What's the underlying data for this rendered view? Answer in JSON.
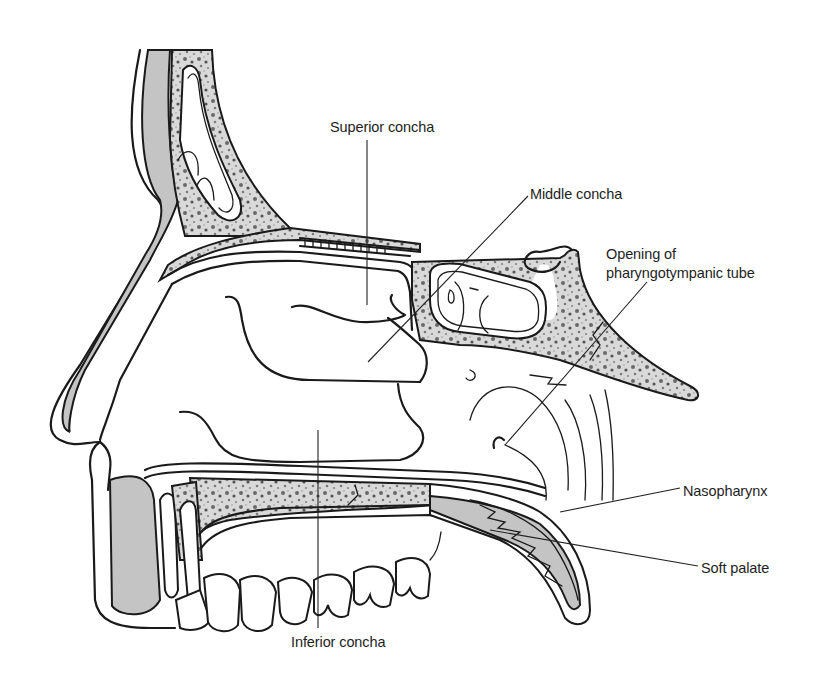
{
  "figure": {
    "colors": {
      "outline": "#1a1a1a",
      "cartilage_fill": "#c4c4c4",
      "bone_fill": "#b0b0b0",
      "background": "#ffffff",
      "label_text": "#1e1e1e"
    }
  },
  "labels": [
    {
      "id": "superior-concha",
      "text": "Superior concha",
      "x": 330,
      "y": 119
    },
    {
      "id": "middle-concha",
      "text": "Middle concha",
      "x": 530,
      "y": 186
    },
    {
      "id": "opening-line1",
      "text": "Opening of",
      "x": 606,
      "y": 246
    },
    {
      "id": "opening-line2",
      "text": "pharyngotympanic tube",
      "x": 606,
      "y": 265
    },
    {
      "id": "nasopharynx",
      "text": "Nasopharynx",
      "x": 683,
      "y": 483
    },
    {
      "id": "soft-palate",
      "text": "Soft palate",
      "x": 701,
      "y": 560
    },
    {
      "id": "inferior-concha",
      "text": "Inferior concha",
      "x": 291,
      "y": 634
    }
  ]
}
